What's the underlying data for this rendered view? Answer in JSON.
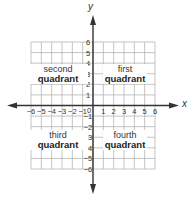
{
  "diagram": {
    "type": "coordinate-plane",
    "x_axis_label": "x",
    "y_axis_label": "y",
    "x_ticks": [
      "-6",
      "-5",
      "-4",
      "-3",
      "-2",
      "-1",
      "1",
      "2",
      "3",
      "4",
      "5",
      "6"
    ],
    "y_ticks": [
      "6",
      "5",
      "4",
      "3",
      "2",
      "1",
      "-1",
      "-2",
      "-3",
      "-4",
      "-5",
      "-6"
    ],
    "origin_label": "0",
    "quadrants": {
      "first": {
        "line1": "first",
        "line2": "quadrant"
      },
      "second": {
        "line1": "second",
        "line2": "quadrant"
      },
      "third": {
        "line1": "third",
        "line2": "quadrant"
      },
      "fourth": {
        "line1": "fourth",
        "line2": "quadrant"
      }
    },
    "colors": {
      "grid": "#b5b5b5",
      "axis": "#333333",
      "text": "#333333"
    }
  }
}
